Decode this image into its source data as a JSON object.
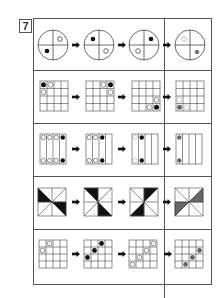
{
  "problem": {
    "number": "7"
  },
  "colors": {
    "line": "#555555",
    "black": "#111111",
    "gray": "#777777",
    "white": "#ffffff"
  },
  "puzzle": {
    "description": "Five sequence puzzles: three figures followed by arrows, the fourth column (answer) separated by a vertical divider.",
    "rows": [
      {
        "type": "circle-quadrants",
        "figures": [
          {
            "black": "bottom-left",
            "white": "top-right"
          },
          {
            "black": "top-left",
            "white": "bottom-right"
          },
          {
            "black": "top-right",
            "white": "bottom-left"
          },
          {
            "gray_light": "top-left",
            "gray_dark": "bottom-right"
          }
        ]
      },
      {
        "type": "grid-4x4",
        "figures": [
          {
            "black": [
              [
                0,
                0
              ]
            ],
            "white": [
              [
                0,
                1
              ],
              [
                1,
                0
              ]
            ]
          },
          {
            "black": [
              [
                0,
                3
              ]
            ],
            "white": [
              [
                0,
                2
              ],
              [
                1,
                3
              ]
            ]
          },
          {
            "black": [
              [
                3,
                3
              ]
            ],
            "white": [
              [
                3,
                2
              ],
              [
                2,
                3
              ]
            ]
          },
          {
            "black": [
              [
                3,
                0
              ]
            ],
            "white": [
              [
                2,
                0
              ],
              [
                3,
                1
              ]
            ]
          }
        ]
      },
      {
        "type": "columns-4",
        "figures": [
          {
            "black_cols": [
              3
            ],
            "white_cols": [
              0,
              1,
              2
            ]
          },
          {
            "black_cols": [
              2
            ],
            "white_cols": [
              0,
              1
            ]
          },
          {
            "black_cols": [
              1
            ],
            "white_cols": [
              0
            ]
          },
          {
            "black_cols": [
              0
            ],
            "white_cols": []
          }
        ]
      },
      {
        "type": "square-8-triangles",
        "figures": [
          {
            "filled": [
              "left-top",
              "right-bottom"
            ]
          },
          {
            "filled": [
              "top-left",
              "bottom-right"
            ]
          },
          {
            "filled": [
              "top-right",
              "bottom-left"
            ]
          },
          {
            "filled": [
              "right-top",
              "left-bottom"
            ]
          }
        ]
      },
      {
        "type": "grid-4x4",
        "figures": [
          {
            "black": [],
            "white": [
              [
                0,
                1
              ],
              [
                1,
                0
              ]
            ]
          },
          {
            "black": [
              [
                0,
                2
              ],
              [
                1,
                1
              ],
              [
                2,
                0
              ]
            ],
            "white": []
          },
          {
            "black": [],
            "white": [
              [
                0,
                3
              ],
              [
                1,
                2
              ],
              [
                2,
                1
              ],
              [
                3,
                0
              ]
            ]
          },
          {
            "black": [
              [
                1,
                3
              ],
              [
                2,
                2
              ],
              [
                3,
                1
              ]
            ],
            "white": []
          }
        ]
      }
    ]
  }
}
